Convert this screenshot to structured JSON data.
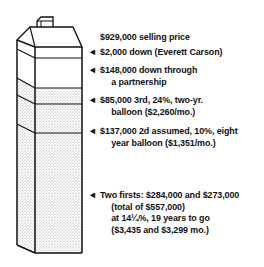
{
  "diagram": {
    "type": "stacked-house-financing",
    "colors": {
      "line": "#111111",
      "fill": "#ffffff",
      "dots": "#9a9a9a"
    },
    "segments": [
      {
        "id": "selling-price",
        "text_lines": [
          "$929,000 selling price"
        ],
        "has_arrow": false
      },
      {
        "id": "down-everett",
        "text_lines": [
          "$2,000 down (Everett Carson)"
        ],
        "has_arrow": true
      },
      {
        "id": "down-partnership",
        "text_lines": [
          "$148,000 down through",
          "a partnership"
        ],
        "has_arrow": true
      },
      {
        "id": "third-mortgage",
        "text_lines": [
          "$85,000 3rd, 24%, two-yr.",
          "balloon ($2,260/mo.)"
        ],
        "has_arrow": true
      },
      {
        "id": "second-assumed",
        "text_lines": [
          "$137,000 2d assumed, 10%, eight",
          "year balloon ($1,351/mo.)"
        ],
        "has_arrow": true
      },
      {
        "id": "two-firsts",
        "text_lines": [
          "Two firsts: $284,000 and $273,000",
          "(total of $557,000)",
          "at 14¼%, 19 years to go",
          "($3,435 and $3,299 mo.)"
        ],
        "has_arrow": true
      }
    ],
    "arrow_glyph": "◄"
  }
}
